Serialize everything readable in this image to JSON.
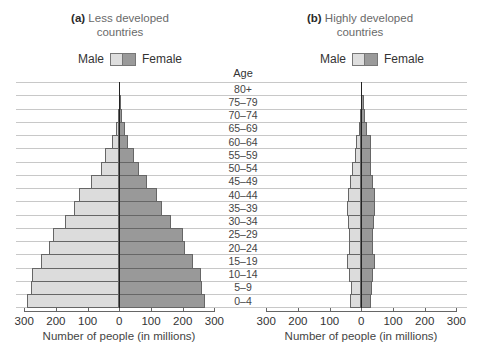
{
  "chart_data": [
    {
      "type": "bar",
      "orientation": "horizontal",
      "title": "(a) Less developed countries",
      "title_bold": "(a)",
      "title_rest": "Less developed",
      "title_line2": "countries",
      "xlabel": "Number of people (in millions)",
      "ylabel": "Age",
      "xlim": [
        -300,
        300
      ],
      "xticks": [
        "300",
        "200",
        "100",
        "0",
        "100",
        "200",
        "300"
      ],
      "legend": [
        "Male",
        "Female"
      ],
      "categories": [
        "0–4",
        "5–9",
        "10–14",
        "15–19",
        "20–24",
        "25–29",
        "30–34",
        "35–39",
        "40–44",
        "45–49",
        "50–54",
        "55–59",
        "60–64",
        "65–69",
        "70–74",
        "75–79",
        "80+"
      ],
      "series": [
        {
          "name": "Male",
          "color": "#dcdcdc",
          "values": [
            290,
            280,
            275,
            248,
            222,
            208,
            170,
            143,
            127,
            88,
            59,
            44,
            23,
            10,
            4,
            1,
            0
          ]
        },
        {
          "name": "Female",
          "color": "#999999",
          "values": [
            270,
            260,
            258,
            232,
            207,
            200,
            163,
            135,
            119,
            88,
            61,
            46,
            27,
            18,
            10,
            3,
            1
          ]
        }
      ],
      "grid": "horizontal",
      "legend_position": "top"
    },
    {
      "type": "bar",
      "orientation": "horizontal",
      "title": "(b) Highly developed countries",
      "title_bold": "(b)",
      "title_rest": "Highly developed",
      "title_line2": "countries",
      "xlabel": "Number of people (in millions)",
      "ylabel": "Age",
      "xlim": [
        -300,
        300
      ],
      "xticks": [
        "300",
        "200",
        "100",
        "0",
        "100",
        "200",
        "300"
      ],
      "legend": [
        "Male",
        "Female"
      ],
      "categories": [
        "0–4",
        "5–9",
        "10–14",
        "15–19",
        "20–24",
        "25–29",
        "30–34",
        "35–39",
        "40–44",
        "45–49",
        "50–54",
        "55–59",
        "60–64",
        "65–69",
        "70–74",
        "75–79",
        "80+"
      ],
      "series": [
        {
          "name": "Male",
          "color": "#dcdcdc",
          "values": [
            36,
            33,
            38,
            44,
            40,
            40,
            42,
            44,
            42,
            36,
            29,
            19,
            17,
            8,
            4,
            1,
            0
          ]
        },
        {
          "name": "Female",
          "color": "#999999",
          "values": [
            32,
            34,
            38,
            42,
            38,
            38,
            40,
            42,
            44,
            38,
            32,
            32,
            30,
            17,
            13,
            8,
            1
          ]
        }
      ],
      "grid": "horizontal",
      "legend_position": "top"
    }
  ],
  "age_header": "Age"
}
